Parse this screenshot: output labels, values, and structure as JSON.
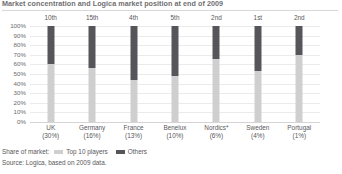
{
  "title": "Market concentration and Logica market position at end of 2009",
  "yaxis": {
    "ticks": [
      "100%",
      "90%",
      "80%",
      "70%",
      "60%",
      "50%",
      "40%",
      "30%",
      "20%",
      "10%",
      "0%"
    ]
  },
  "legend": {
    "title": "Share of market:",
    "items": [
      {
        "label": "Top 10 players",
        "color": "#cfcfcf"
      },
      {
        "label": "Others",
        "color": "#56565a"
      }
    ]
  },
  "source": "Source: Logica, based on 2009 data.",
  "colors": {
    "top10": "#cfcfcf",
    "others": "#56565a",
    "text": "#58585a",
    "grid": "#eceaea"
  },
  "chart_data": {
    "type": "bar",
    "stacked": true,
    "title": "Market concentration and Logica market position at end of 2009",
    "xlabel": "",
    "ylabel": "",
    "ylim": [
      0,
      100
    ],
    "ytick_labels": [
      "0%",
      "10%",
      "20%",
      "30%",
      "40%",
      "50%",
      "60%",
      "70%",
      "80%",
      "90%",
      "100%"
    ],
    "grid": true,
    "legend_position": "bottom-left",
    "categories": [
      "UK",
      "Germany",
      "France",
      "Benelux",
      "Nordics*",
      "Sweden",
      "Portugal"
    ],
    "category_shares": [
      "(30%)",
      "(16%)",
      "(13%)",
      "(10%)",
      "(6%)",
      "(4%)",
      "(1%)"
    ],
    "ranks": [
      "10th",
      "15th",
      "4th",
      "5th",
      "2nd",
      "1st",
      "2nd"
    ],
    "series": [
      {
        "name": "Top 10 players",
        "color": "#cfcfcf",
        "values": [
          60,
          56,
          44,
          48,
          66,
          53,
          70
        ]
      },
      {
        "name": "Others",
        "color": "#56565a",
        "values": [
          40,
          44,
          56,
          52,
          34,
          47,
          30
        ]
      }
    ],
    "annotations": [
      "* Nordics excludes Sweden"
    ],
    "source": "Source: Logica, based on 2009 data."
  },
  "bars": [
    {
      "category": "UK",
      "share": "(30%)",
      "rank": "10th",
      "top10": 60,
      "others": 40
    },
    {
      "category": "Germany",
      "share": "(16%)",
      "rank": "15th",
      "top10": 56,
      "others": 44
    },
    {
      "category": "France",
      "share": "(13%)",
      "rank": "4th",
      "top10": 44,
      "others": 56
    },
    {
      "category": "Benelux",
      "share": "(10%)",
      "rank": "5th",
      "top10": 48,
      "others": 52
    },
    {
      "category": "Nordics*",
      "share": "(6%)",
      "rank": "2nd",
      "top10": 66,
      "others": 34
    },
    {
      "category": "Sweden",
      "share": "(4%)",
      "rank": "1st",
      "top10": 53,
      "others": 47
    },
    {
      "category": "Portugal",
      "share": "(1%)",
      "rank": "2nd",
      "top10": 70,
      "others": 30
    }
  ]
}
